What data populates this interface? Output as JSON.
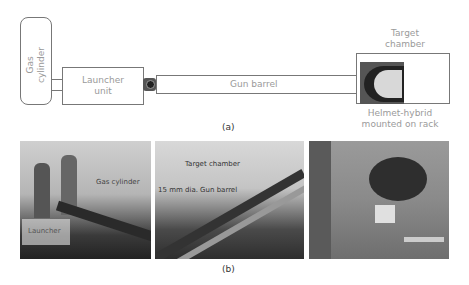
{
  "diagram": {
    "panel_a": {
      "gas_cylinder_label": "Gas cylinder",
      "gas_cylinder_label_line1": "Gas",
      "gas_cylinder_label_line2": "cylinder",
      "launcher_label_line1": "Launcher",
      "launcher_label_line2": "unit",
      "gun_barrel_label": "Gun barrel",
      "target_chamber_line1": "Target",
      "target_chamber_line2": "chamber",
      "helmet_label_line1": "Helmet-hybrid",
      "helmet_label_line2": "mounted on rack",
      "caption": "(a)"
    },
    "panel_b": {
      "photo1_annotations": [
        "Gas cylinder",
        "Launcher"
      ],
      "photo2_annotations": [
        "Target chamber",
        "15 mm dia. Gun barrel"
      ],
      "caption": "(b)"
    }
  },
  "colors": {
    "outline": "#777777",
    "label_text": "#9a9a9a",
    "caption_text": "#333333"
  }
}
